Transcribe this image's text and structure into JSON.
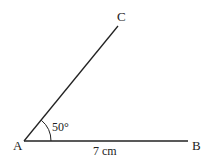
{
  "diagram": {
    "type": "geometric-angle-construction",
    "points": {
      "A": {
        "label": "A",
        "x": 24,
        "y": 141
      },
      "B": {
        "label": "B",
        "x": 188,
        "y": 141
      },
      "C": {
        "label": "C",
        "x": 118,
        "y": 26
      }
    },
    "segments": [
      {
        "from": "A",
        "to": "B",
        "label": "7 cm"
      },
      {
        "from": "A",
        "to": "C",
        "label": ""
      }
    ],
    "angle": {
      "vertex": "A",
      "between": [
        "B",
        "C"
      ],
      "label": "50°",
      "degrees": 50
    },
    "colors": {
      "line": "#222222",
      "text": "#222222",
      "background": "#ffffff"
    }
  }
}
